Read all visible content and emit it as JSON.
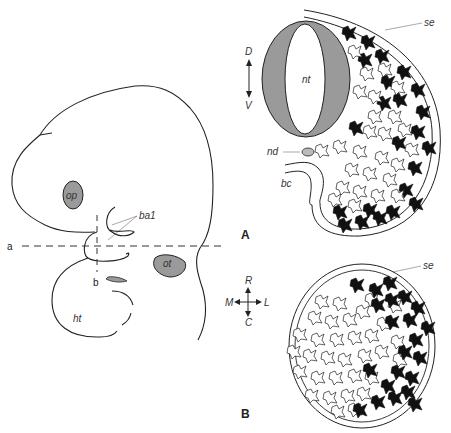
{
  "figure": {
    "panels": [
      {
        "id": "A",
        "label": "A",
        "description": "Transverse section through neural tube region of embryo"
      },
      {
        "id": "B",
        "label": "B",
        "description": "Section at level b"
      }
    ],
    "embryo": {
      "section_lines": {
        "a": "a",
        "b": "b"
      },
      "labels": {
        "op": "op",
        "ba1": "ba1",
        "ot": "ot",
        "ht": "ht"
      }
    },
    "panel_a": {
      "labels": {
        "nt": "nt",
        "nd": "nd",
        "bc": "bc",
        "se": "se"
      },
      "axis": {
        "dorsal": "D",
        "ventral": "V"
      }
    },
    "panel_b": {
      "labels": {
        "se": "se"
      },
      "axis": {
        "rostral": "R",
        "caudal": "C",
        "medial": "M",
        "lateral": "L"
      }
    },
    "colors": {
      "line": "#222222",
      "fill_gray": "#9a9a9a",
      "cell_black": "#111111",
      "cell_white": "#ffffff"
    }
  }
}
